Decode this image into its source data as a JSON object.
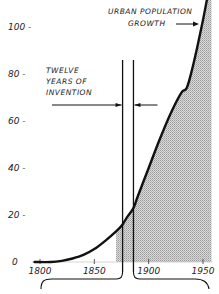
{
  "chart_data": {
    "type": "area",
    "title": "",
    "xlabel": "",
    "ylabel": "",
    "xlim": [
      1795,
      1958
    ],
    "ylim": [
      0,
      110
    ],
    "grid": false,
    "x_ticks": [
      1800,
      1850,
      1900,
      1950
    ],
    "x_tick_labels": [
      "1800",
      "1850",
      "1900",
      "1950"
    ],
    "y_ticks": [
      0,
      20,
      40,
      60,
      80,
      100
    ],
    "y_tick_labels": [
      "0",
      "20 -",
      "40 -",
      "60 -",
      "80 -",
      "100 -"
    ],
    "series": [
      {
        "name": "Urban population growth",
        "x": [
          1795,
          1810,
          1820,
          1830,
          1840,
          1850,
          1860,
          1870,
          1876,
          1880,
          1886,
          1890,
          1900,
          1910,
          1920,
          1930,
          1935,
          1940,
          1945,
          1950,
          1955
        ],
        "y": [
          0,
          0,
          0.5,
          1.5,
          3,
          5.5,
          9,
          13,
          16,
          19,
          23,
          28,
          40,
          52,
          63,
          72,
          74,
          82,
          92,
          103,
          115
        ],
        "shaded_from_x": 1870
      }
    ],
    "annotations": [
      {
        "text": "URBAN POPULATION",
        "line2": "GROWTH",
        "arrow": "right",
        "target": "curve"
      },
      {
        "text": "TWELVE",
        "line2": "YEARS OF",
        "line3": "INVENTION",
        "bracket_from": 1876,
        "bracket_to": 1886
      }
    ],
    "invention_period": [
      1876,
      1886
    ]
  }
}
